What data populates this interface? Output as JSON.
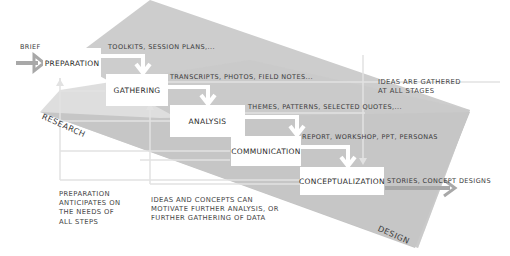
{
  "diagram": {
    "colors": {
      "research_band": "#c9c9c9",
      "design_band": "#bdbdbd",
      "box_fill": "#ffffff",
      "arrow_white": "#ffffff",
      "arrow_gray": "#a8a8a8",
      "feedback_line": "#dcdcdc"
    },
    "input": {
      "label": "BRIEF"
    },
    "bands": {
      "research": "RESEARCH",
      "design": "DESIGN"
    },
    "stages": [
      {
        "id": "preparation",
        "label": "PREPARATION",
        "output": "TOOLKITS, SESSION PLANS,..."
      },
      {
        "id": "gathering",
        "label": "GATHERING",
        "output": "TRANSCRIPTS, PHOTOS, FIELD NOTES..."
      },
      {
        "id": "analysis",
        "label": "ANALYSIS",
        "output": "THEMES, PATTERNS, SELECTED QUOTES,..."
      },
      {
        "id": "communication",
        "label": "COMMUNICATION",
        "output": "REPORT, WORKSHOP, PPT, PERSONAS"
      },
      {
        "id": "conceptualization",
        "label": "CONCEPTUALIZATION",
        "output": "STORIES, CONCEPT DESIGNS"
      }
    ],
    "notes": {
      "ideas_gathered": "IDEAS ARE GATHERED\nAT ALL STAGES",
      "preparation_anticipates": "PREPARATION\nANTICIPATES ON\nTHE NEEDS OF\nALL STEPS",
      "ideas_motivate": "IDEAS AND CONCEPTS CAN\nMOTIVATE FURTHER ANALYSIS, OR\nFURTHER GATHERING OF DATA"
    }
  }
}
